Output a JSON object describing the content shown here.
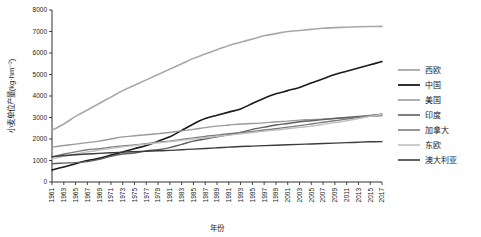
{
  "chart_data": {
    "type": "line",
    "title": "",
    "xlabel": "年份",
    "ylabel": "小麦单位产量(kg·hm⁻²)",
    "ylim": [
      0,
      8000
    ],
    "yticks": [
      0,
      1000,
      2000,
      3000,
      4000,
      5000,
      6000,
      7000,
      8000
    ],
    "grid": false,
    "legend_position": "right",
    "x": [
      1961,
      1963,
      1965,
      1967,
      1969,
      1971,
      1973,
      1975,
      1977,
      1979,
      1981,
      1983,
      1985,
      1987,
      1989,
      1991,
      1993,
      1995,
      1997,
      1999,
      2001,
      2003,
      2005,
      2007,
      2009,
      2011,
      2013,
      2015,
      2017
    ],
    "xticklabels": [
      "1961",
      "1963",
      "1965",
      "1967",
      "1969",
      "1971",
      "1973",
      "1975",
      "1977",
      "1979",
      "1981",
      "1983",
      "1985",
      "1987",
      "1989",
      "1991",
      "1993",
      "1995",
      "1997",
      "1999",
      "2001",
      "2003",
      "2005",
      "2007",
      "2009",
      "2011",
      "2013",
      "2015",
      "2017"
    ],
    "series": [
      {
        "name": "西欧",
        "color": "#a8a8a8",
        "width": 1.6,
        "values": [
          2400,
          2700,
          3050,
          3350,
          3650,
          3950,
          4250,
          4500,
          4750,
          5000,
          5250,
          5500,
          5750,
          5950,
          6150,
          6350,
          6500,
          6650,
          6800,
          6900,
          7000,
          7050,
          7100,
          7150,
          7180,
          7200,
          7220,
          7230,
          7240
        ]
      },
      {
        "name": "中国",
        "color": "#1a1a1a",
        "width": 1.6,
        "values": [
          560,
          700,
          850,
          1000,
          1100,
          1250,
          1400,
          1550,
          1700,
          1900,
          2100,
          2400,
          2700,
          2950,
          3100,
          3250,
          3400,
          3650,
          3900,
          4100,
          4250,
          4400,
          4600,
          4800,
          5000,
          5150,
          5300,
          5450,
          5600
        ]
      },
      {
        "name": "美国",
        "color": "#9b9b9b",
        "width": 1.4,
        "values": [
          1620,
          1700,
          1760,
          1830,
          1900,
          2000,
          2100,
          2150,
          2200,
          2250,
          2300,
          2380,
          2450,
          2530,
          2600,
          2650,
          2700,
          2720,
          2750,
          2800,
          2830,
          2880,
          2900,
          2930,
          2960,
          2990,
          3020,
          3050,
          3080
        ]
      },
      {
        "name": "印度",
        "color": "#5e5e5e",
        "width": 1.4,
        "values": [
          850,
          880,
          900,
          950,
          1050,
          1200,
          1300,
          1350,
          1450,
          1500,
          1600,
          1750,
          1900,
          2000,
          2100,
          2200,
          2300,
          2450,
          2550,
          2650,
          2720,
          2800,
          2850,
          2900,
          2950,
          3000,
          3050,
          3100,
          3150
        ]
      },
      {
        "name": "加拿大",
        "color": "#7d7d7d",
        "width": 1.4,
        "values": [
          1150,
          1300,
          1400,
          1500,
          1550,
          1620,
          1680,
          1720,
          1780,
          1850,
          1900,
          1980,
          2050,
          2120,
          2180,
          2250,
          2300,
          2350,
          2420,
          2480,
          2550,
          2620,
          2700,
          2780,
          2850,
          2930,
          3000,
          3080,
          3150
        ]
      },
      {
        "name": "东欧",
        "color": "#c0c0c0",
        "width": 1.4,
        "values": [
          1080,
          1200,
          1300,
          1400,
          1480,
          1560,
          1640,
          1700,
          1760,
          1820,
          1880,
          1940,
          2000,
          2060,
          2120,
          2180,
          2240,
          2300,
          2360,
          2420,
          2480,
          2540,
          2600,
          2680,
          2760,
          2850,
          2950,
          3050,
          3150
        ]
      },
      {
        "name": "澳大利亚",
        "color": "#3c3c3c",
        "width": 1.4,
        "values": [
          1180,
          1230,
          1270,
          1300,
          1330,
          1360,
          1390,
          1410,
          1430,
          1450,
          1470,
          1500,
          1530,
          1560,
          1590,
          1620,
          1650,
          1670,
          1690,
          1710,
          1730,
          1750,
          1770,
          1790,
          1810,
          1830,
          1850,
          1870,
          1880
        ]
      }
    ]
  },
  "legend": {
    "items": [
      {
        "label": "西欧"
      },
      {
        "label": "中国"
      },
      {
        "label": "美国"
      },
      {
        "label": "印度"
      },
      {
        "label": "加拿大"
      },
      {
        "label": "东欧"
      },
      {
        "label": "澳大利亚"
      }
    ]
  }
}
